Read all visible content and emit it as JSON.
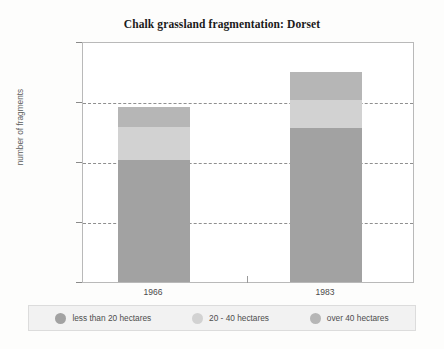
{
  "chart_data": {
    "type": "bar",
    "subtype": "stacked-bar",
    "title": "Chalk grassland fragmentation: Dorset",
    "xlabel": "",
    "ylabel": "number of fragments",
    "categories": [
      "1966",
      "1983"
    ],
    "ylim": [
      0,
      200
    ],
    "yticks": [
      0,
      50,
      100,
      150,
      200
    ],
    "ytick_labels": [
      "0",
      "50",
      "100",
      "150",
      "200"
    ],
    "gridlines": [
      50,
      100,
      150
    ],
    "grid": true,
    "grid_style": "dashed",
    "legend_position": "bottom",
    "series": [
      {
        "name": "less than 20 hectares",
        "color": "#a2a2a2",
        "values": [
          101,
          128
        ]
      },
      {
        "name": "20 - 40 hectares",
        "color": "#d2d2d2",
        "values": [
          28,
          23
        ]
      },
      {
        "name": "over 40 hectares",
        "color": "#b6b6b6",
        "values": [
          16,
          23
        ]
      }
    ],
    "totals": [
      145,
      174
    ]
  },
  "legend": {
    "items": [
      {
        "label": "less than 20 hectares",
        "color": "#a2a2a2"
      },
      {
        "label": "20 - 40 hectares",
        "color": "#d2d2d2"
      },
      {
        "label": "over 40 hectares",
        "color": "#b6b6b6"
      }
    ]
  },
  "axis": {
    "y_title": "number of fragments",
    "y_labels": [
      "200",
      "150",
      "100",
      "50",
      "0"
    ],
    "x_labels": [
      "1966",
      "1983"
    ]
  },
  "colors": {
    "plot_border": "#b9b9b9",
    "gridline": "#8f8f8f",
    "page_background": "#fdfdfc",
    "plot_background": "#ffffff",
    "legend_background": "#f2f2f2",
    "title_text": "#1a1a1a",
    "axis_text": "#4a4a4a"
  }
}
